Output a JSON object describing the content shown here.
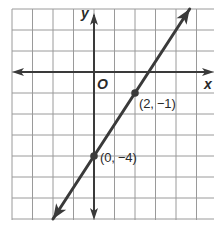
{
  "chart_data": {
    "type": "line",
    "title": "",
    "xlabel": "x",
    "ylabel": "y",
    "origin_label": "O",
    "grid": true,
    "xlim": [
      -4,
      5.8
    ],
    "ylim": [
      -7,
      3
    ],
    "grid_step": 1,
    "series": [
      {
        "name": "line",
        "equation": "y = 3/2 x - 4",
        "slope": 1.5,
        "intercept": -4,
        "arrows_both_ends": true,
        "color": "#3a3a3a"
      }
    ],
    "points": [
      {
        "x": 2,
        "y": -1,
        "label": "(2, −1)"
      },
      {
        "x": 0,
        "y": -4,
        "label": "(0, −4)"
      }
    ]
  },
  "colors": {
    "grid": "#9a9a9a",
    "axis": "#3a3a3a",
    "line": "#3a3a3a",
    "background": "#ffffff"
  }
}
